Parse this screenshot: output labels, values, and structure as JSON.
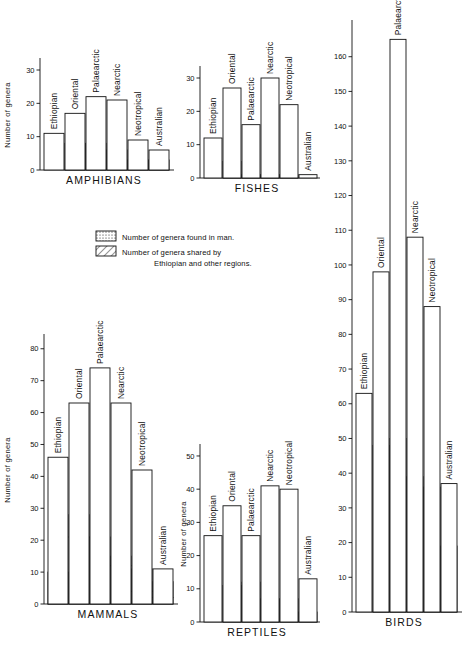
{
  "figure": {
    "y_axis_title": "Number  of  genera",
    "regions": [
      "Ethiopian",
      "Oriental",
      "Palaearctic",
      "Nearctic",
      "Neotropical",
      "Australian"
    ]
  },
  "legend": {
    "items": [
      {
        "pattern": "dots",
        "label": "Number of genera found in man."
      },
      {
        "pattern": "hatch",
        "label": "Number of genera shared by",
        "label2": "Ethiopian and other regions."
      }
    ]
  },
  "chart_data": [
    {
      "type": "bar",
      "title": "AMPHIBIANS",
      "xlabel": "",
      "ylabel": "Number  of  genera",
      "ylim": [
        0,
        33
      ],
      "yticks": [
        0,
        10,
        20,
        30
      ],
      "ytick_labels": [
        "0",
        "10",
        "20",
        "30"
      ],
      "categories": [
        "Ethiopian",
        "Oriental",
        "Palaearctic",
        "Nearctic",
        "Neotropical",
        "Australian"
      ],
      "series": [
        {
          "name": "total",
          "values": [
            11,
            17,
            22,
            21,
            9,
            6
          ]
        },
        {
          "name": "shared_with_ethiopian",
          "pattern": "hatch",
          "values": [
            0,
            8,
            8,
            6,
            3,
            3
          ]
        },
        {
          "name": "found_in_man",
          "pattern": "dots",
          "values": [
            0,
            0,
            0,
            0,
            0,
            0
          ]
        }
      ]
    },
    {
      "type": "bar",
      "title": "FISHES",
      "xlabel": "",
      "ylabel": "",
      "ylim": [
        0,
        33
      ],
      "yticks": [
        0,
        10,
        20,
        30
      ],
      "ytick_labels": [
        "0",
        "10",
        "20",
        "30"
      ],
      "categories": [
        "Ethiopian",
        "Oriental",
        "Palaearctic",
        "Nearctic",
        "Neotropical",
        "Australian"
      ],
      "series": [
        {
          "name": "total",
          "values": [
            12,
            27,
            16,
            30,
            22,
            1
          ]
        },
        {
          "name": "shared_with_ethiopian",
          "pattern": "hatch",
          "values": [
            0,
            5,
            1,
            1,
            1,
            0
          ]
        },
        {
          "name": "found_in_man",
          "pattern": "dots",
          "values": [
            0,
            0,
            0,
            0,
            0,
            0
          ]
        }
      ]
    },
    {
      "type": "bar",
      "title": "MAMMALS",
      "xlabel": "",
      "ylabel": "Number  of  genera",
      "ylim": [
        0,
        84
      ],
      "yticks": [
        0,
        10,
        20,
        30,
        40,
        50,
        60,
        70,
        80
      ],
      "ytick_labels": [
        "0",
        "10",
        "20",
        "30",
        "40",
        "50",
        "60",
        "70",
        "80"
      ],
      "categories": [
        "Ethiopian",
        "Oriental",
        "Palaearctic",
        "Nearctic",
        "Neotropical",
        "Australian"
      ],
      "series": [
        {
          "name": "total",
          "values": [
            46,
            63,
            74,
            63,
            42,
            11
          ]
        },
        {
          "name": "shared_with_ethiopian",
          "pattern": "hatch",
          "values": [
            0,
            28,
            21,
            15,
            11,
            7
          ]
        },
        {
          "name": "found_in_man",
          "pattern": "dots",
          "values": [
            10,
            21,
            21,
            12,
            4,
            2
          ]
        }
      ]
    },
    {
      "type": "bar",
      "title": "REPTILES",
      "xlabel": "",
      "ylabel": "Number  of  genera",
      "ylim": [
        0,
        53
      ],
      "yticks": [
        0,
        10,
        20,
        30,
        40,
        50
      ],
      "ytick_labels": [
        "0",
        "10",
        "20",
        "30",
        "40",
        "50"
      ],
      "categories": [
        "Ethiopian",
        "Oriental",
        "Palaearctic",
        "Nearctic",
        "Neotropical",
        "Australian"
      ],
      "series": [
        {
          "name": "total",
          "values": [
            26,
            35,
            26,
            41,
            40,
            13
          ]
        },
        {
          "name": "shared_with_ethiopian",
          "pattern": "hatch",
          "values": [
            0,
            11,
            12,
            7,
            7,
            3
          ]
        },
        {
          "name": "found_in_man",
          "pattern": "dots",
          "values": [
            0,
            0,
            0,
            0,
            0,
            0
          ]
        }
      ]
    },
    {
      "type": "bar",
      "title": "BIRDS",
      "xlabel": "",
      "ylabel": "",
      "ylim": [
        0,
        170
      ],
      "yticks": [
        0,
        10,
        20,
        30,
        40,
        50,
        60,
        70,
        80,
        90,
        100,
        110,
        120,
        130,
        140,
        150,
        160
      ],
      "ytick_labels": [
        "0",
        "10",
        "20",
        "30",
        "40",
        "50",
        "60",
        "70",
        "80",
        "90",
        "100",
        "110",
        "120",
        "130",
        "140",
        "150",
        "160"
      ],
      "categories": [
        "Ethiopian",
        "Oriental",
        "Palaearctic",
        "Nearctic",
        "Neotropical",
        "Australian"
      ],
      "series": [
        {
          "name": "total",
          "values": [
            63,
            98,
            165,
            108,
            88,
            37
          ]
        },
        {
          "name": "shared_with_ethiopian",
          "pattern": "hatch",
          "values": [
            0,
            48,
            50,
            39,
            36,
            19
          ]
        },
        {
          "name": "found_in_man",
          "pattern": "dots",
          "values": [
            0,
            0,
            0,
            0,
            0,
            0
          ]
        }
      ]
    }
  ]
}
